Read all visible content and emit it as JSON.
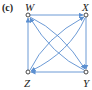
{
  "panel_label": "(c)",
  "nodes": {
    "W": {
      "label": "W",
      "x": 28,
      "y": 15
    },
    "X": {
      "label": "X",
      "x": 86,
      "y": 15
    },
    "Z": {
      "label": "Z",
      "x": 28,
      "y": 72
    },
    "Y": {
      "label": "Y",
      "x": 86,
      "y": 72
    }
  },
  "edges": [
    {
      "from": "W",
      "to": "X",
      "shape": "straight"
    },
    {
      "from": "X",
      "to": "Y",
      "shape": "straight"
    },
    {
      "from": "Y",
      "to": "Z",
      "shape": "straight"
    },
    {
      "from": "Z",
      "to": "W",
      "shape": "straight"
    },
    {
      "from": "W",
      "to": "Y",
      "shape": "curved"
    },
    {
      "from": "Y",
      "to": "W",
      "shape": "curved"
    },
    {
      "from": "Z",
      "to": "X",
      "shape": "curved"
    },
    {
      "from": "X",
      "to": "Z",
      "shape": "curved"
    }
  ],
  "colors": {
    "edge": "#5b8fd0",
    "node_stroke": "#333333",
    "text": "#222222"
  }
}
